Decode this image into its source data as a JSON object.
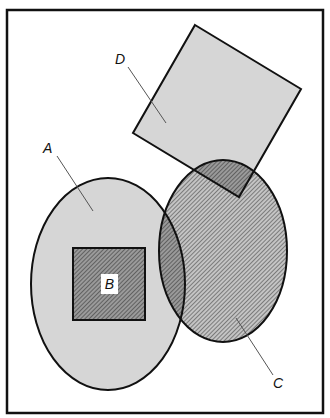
{
  "diagram": {
    "type": "venn-style set diagram",
    "frame": {
      "x": 7,
      "y": 10,
      "width": 316,
      "height": 403
    },
    "colors": {
      "background": "#ffffff",
      "light_fill": "#d6d6d6",
      "overlap_fill": "#a8a8a8",
      "hatch_fill": "#bcbcbc",
      "hatch_line": "#555555",
      "stroke": "#111111",
      "leader": "#555555"
    },
    "shapes": [
      {
        "id": "A",
        "kind": "ellipse",
        "cx": 108,
        "cy": 284,
        "rx": 77,
        "ry": 106,
        "fill": "light",
        "label": "A"
      },
      {
        "id": "B",
        "kind": "square",
        "x": 73,
        "y": 248,
        "width": 72,
        "height": 72,
        "fill": "hatched",
        "label": "B"
      },
      {
        "id": "C",
        "kind": "ellipse",
        "cx": 223,
        "cy": 251,
        "rx": 64,
        "ry": 91,
        "fill": "hatched",
        "label": "C"
      },
      {
        "id": "D",
        "kind": "rotated-square",
        "points": "195,25 301,89 239,197 133,133",
        "fill": "light",
        "label": "D"
      }
    ],
    "labels": {
      "A": "A",
      "B": "B",
      "C": "C",
      "D": "D"
    }
  }
}
